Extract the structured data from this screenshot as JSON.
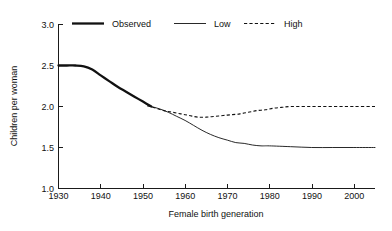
{
  "chart_data": {
    "type": "line",
    "title": "",
    "xlabel": "Female birth generation",
    "ylabel": "Children per woman",
    "xlim": [
      1930,
      2005
    ],
    "ylim": [
      1.0,
      3.0
    ],
    "xticks": [
      1930,
      1940,
      1950,
      1960,
      1970,
      1980,
      1990,
      2000
    ],
    "yticks": [
      1.0,
      1.5,
      2.0,
      2.5,
      3.0
    ],
    "xtick_labels": [
      "1930",
      "1940",
      "1950",
      "1960",
      "1970",
      "1980",
      "1990",
      "2000"
    ],
    "ytick_labels": [
      "1.0",
      "1.5",
      "2.0",
      "2.5",
      "3.0"
    ],
    "grid": false,
    "legend_position": "top-center",
    "series": [
      {
        "name": "Observed",
        "style": "solid-thick",
        "color": "#111111",
        "x": [
          1930,
          1932,
          1934,
          1936,
          1938,
          1940,
          1942,
          1944,
          1946,
          1948,
          1950,
          1952
        ],
        "values": [
          2.5,
          2.5,
          2.5,
          2.49,
          2.45,
          2.38,
          2.31,
          2.24,
          2.18,
          2.12,
          2.06,
          2.0
        ]
      },
      {
        "name": "Low",
        "style": "solid-thin",
        "color": "#111111",
        "x": [
          1952,
          1954,
          1956,
          1958,
          1960,
          1962,
          1964,
          1966,
          1968,
          1970,
          1972,
          1974,
          1976,
          1978,
          1980,
          1985,
          1990,
          1995,
          2000,
          2005
        ],
        "values": [
          2.0,
          1.97,
          1.93,
          1.88,
          1.83,
          1.77,
          1.71,
          1.66,
          1.62,
          1.59,
          1.56,
          1.55,
          1.53,
          1.52,
          1.52,
          1.51,
          1.5,
          1.5,
          1.5,
          1.5
        ]
      },
      {
        "name": "High",
        "style": "dashed",
        "color": "#111111",
        "x": [
          1951,
          1953,
          1955,
          1957,
          1959,
          1961,
          1963,
          1965,
          1967,
          1969,
          1971,
          1973,
          1975,
          1977,
          1979,
          1981,
          1983,
          1985,
          1990,
          1995,
          2000,
          2005
        ],
        "values": [
          2.01,
          1.98,
          1.95,
          1.93,
          1.91,
          1.89,
          1.87,
          1.87,
          1.88,
          1.89,
          1.9,
          1.91,
          1.93,
          1.95,
          1.96,
          1.98,
          1.99,
          2.0,
          2.0,
          2.0,
          2.0,
          2.0
        ]
      }
    ],
    "annotations": []
  },
  "legend": {
    "items": [
      {
        "label": "Observed"
      },
      {
        "label": "Low"
      },
      {
        "label": "High"
      }
    ]
  }
}
